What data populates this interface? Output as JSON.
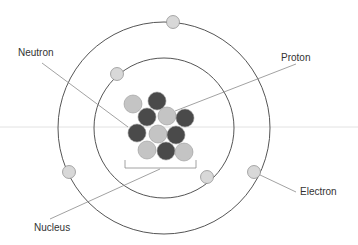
{
  "diagram": {
    "labels": {
      "neutron": "Neutron",
      "proton": "Proton",
      "electron": "Electron",
      "nucleus": "Nucleus"
    },
    "colors": {
      "neutron": "#4a4a4a",
      "proton": "#c4c4c4",
      "electron": "#d8d8d8",
      "orbit": "#555555",
      "leader": "#8a8a8a"
    },
    "orbits": [
      {
        "name": "inner",
        "radius": 70
      },
      {
        "name": "outer",
        "radius": 106
      }
    ],
    "electron_count": 5,
    "nucleus_particles": {
      "protons": 6,
      "neutrons": 6
    }
  }
}
